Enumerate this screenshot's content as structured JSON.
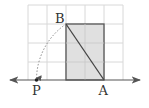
{
  "diagram": {
    "type": "geometry-number-line",
    "grid": {
      "x_lines": [
        28,
        47,
        66,
        85,
        104,
        123
      ],
      "y_lines": [
        5,
        24,
        43,
        62,
        80
      ],
      "color": "#d8d8d8"
    },
    "rectangle": {
      "x": 66,
      "y": 24,
      "width": 38,
      "height": 56,
      "fill": "#e0e0e0",
      "stroke": "#555555"
    },
    "diagonal": {
      "from": "B",
      "to": "A"
    },
    "number_line": {
      "y": 80,
      "x_start": 9,
      "x_end": 141,
      "color": "#555555"
    },
    "arc": {
      "center": "A",
      "from": "B",
      "to": "P",
      "style": "dotted",
      "color": "#888888"
    },
    "points": {
      "B": {
        "label": "B",
        "x": 66,
        "y": 24
      },
      "A": {
        "label": "A",
        "x": 104,
        "y": 80
      },
      "P": {
        "label": "P",
        "x": 36.5,
        "y": 80
      }
    }
  }
}
